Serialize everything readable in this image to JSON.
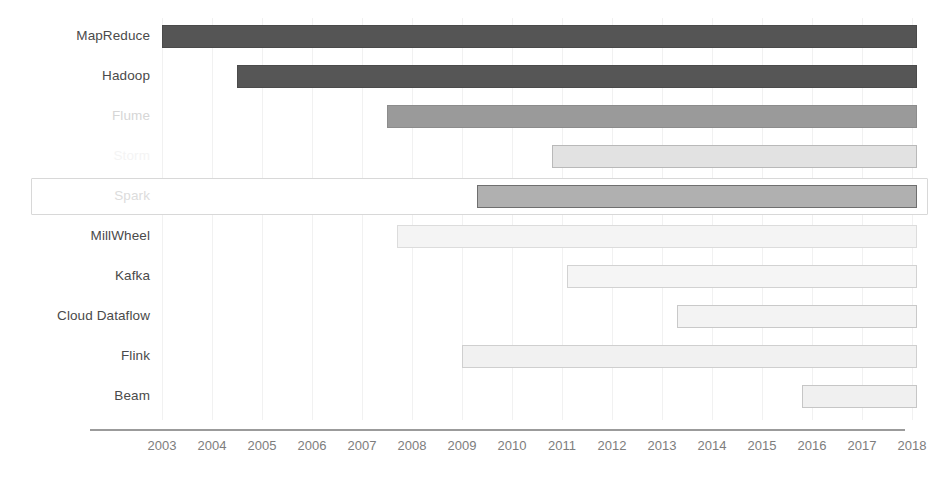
{
  "chart_data": {
    "type": "bar",
    "orientation": "horizontal",
    "subtype": "timeline-gantt",
    "title": "",
    "subtitle": "",
    "xlabel": "",
    "ylabel": "",
    "xlim": [
      2002.6,
      2018.4
    ],
    "grid": true,
    "legend": null,
    "xticks": [
      2003,
      2004,
      2005,
      2006,
      2007,
      2008,
      2009,
      2010,
      2011,
      2012,
      2013,
      2014,
      2015,
      2016,
      2017,
      2018
    ],
    "xtick_labels": [
      "2003",
      "2004",
      "2005",
      "2006",
      "2007",
      "2008",
      "2009",
      "2010",
      "2011",
      "2012",
      "2013",
      "2014",
      "2015",
      "2016",
      "2017",
      "2018"
    ],
    "categories": [
      "MapReduce",
      "Hadoop",
      "Flume",
      "Storm",
      "Spark",
      "MillWheel",
      "Kafka",
      "Cloud Dataflow",
      "Flink",
      "Beam"
    ],
    "bars": [
      {
        "label": "MapReduce",
        "start": 2003.0,
        "end": 2018.1,
        "shade": 0,
        "fill": "#555555",
        "stroke": "#4a4a4a",
        "label_style": "normal",
        "highlighted": false
      },
      {
        "label": "Hadoop",
        "start": 2004.5,
        "end": 2018.1,
        "shade": 1,
        "fill": "#565656",
        "stroke": "#4b4b4b",
        "label_style": "normal",
        "highlighted": false
      },
      {
        "label": "Flume",
        "start": 2007.5,
        "end": 2018.1,
        "shade": 2,
        "fill": "#9a9a9a",
        "stroke": "#8c8c8c",
        "label_style": "faded-1",
        "highlighted": false
      },
      {
        "label": "Storm",
        "start": 2010.8,
        "end": 2018.1,
        "shade": 3,
        "fill": "#e2e2e2",
        "stroke": "#b9b9b9",
        "label_style": "faded-2",
        "highlighted": false
      },
      {
        "label": "Spark",
        "start": 2009.3,
        "end": 2018.1,
        "shade": 4,
        "fill": "#b0b0b0",
        "stroke": "#6f6f6f",
        "label_style": "faded-3",
        "highlighted": true
      },
      {
        "label": "MillWheel",
        "start": 2007.7,
        "end": 2018.1,
        "shade": 5,
        "fill": "#f4f4f4",
        "stroke": "#dcdcdc",
        "label_style": "normal",
        "highlighted": false
      },
      {
        "label": "Kafka",
        "start": 2011.1,
        "end": 2018.1,
        "shade": 6,
        "fill": "#f5f5f5",
        "stroke": "#d2d2d2",
        "label_style": "normal",
        "highlighted": false
      },
      {
        "label": "Cloud Dataflow",
        "start": 2013.3,
        "end": 2018.1,
        "shade": 7,
        "fill": "#f3f3f3",
        "stroke": "#c9c9c9",
        "label_style": "normal",
        "highlighted": false
      },
      {
        "label": "Flink",
        "start": 2009.0,
        "end": 2018.1,
        "shade": 8,
        "fill": "#f1f1f1",
        "stroke": "#cfcfcf",
        "label_style": "normal",
        "highlighted": false
      },
      {
        "label": "Beam",
        "start": 2015.8,
        "end": 2018.1,
        "shade": 9,
        "fill": "#f0f0f0",
        "stroke": "#c6c6c6",
        "label_style": "normal",
        "highlighted": false
      }
    ],
    "colors": {
      "background": "#ffffff",
      "axis": "#9b9b9b",
      "gridline": "#f1f1f1",
      "tick_text": "#7d7d7d",
      "label_text": "#4a4a4a",
      "highlight_border": "#d8d8d8"
    }
  }
}
